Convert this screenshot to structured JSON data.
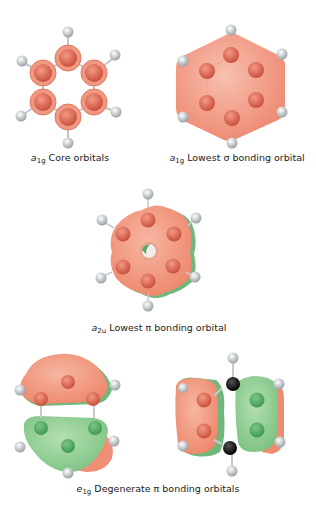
{
  "figure": {
    "panels": [
      {
        "id": "a1g-core",
        "symbol": "a",
        "subscript": "1g",
        "label": "Core orbitals"
      },
      {
        "id": "a1g-sigma",
        "symbol": "a",
        "subscript": "1g",
        "label": "Lowest σ bonding orbital"
      },
      {
        "id": "a2u-pi",
        "symbol": "a",
        "subscript": "2u",
        "label": "Lowest π bonding orbital"
      },
      {
        "id": "e1g-pi",
        "symbol": "e",
        "subscript": "1g",
        "label": "Degenerate π bonding orbitals"
      }
    ],
    "colors": {
      "positive_lobe": "#f0927a",
      "negative_lobe": "#8cc98e",
      "carbon": "#d9604a",
      "hydrogen": "#e4e8ea",
      "node_carbon": "#111111"
    }
  }
}
